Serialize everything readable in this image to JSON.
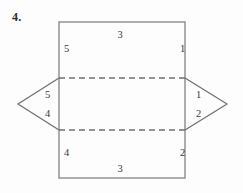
{
  "problem": {
    "number": "4."
  },
  "figure": {
    "name": "net-of-solid-diagram",
    "colors": {
      "stroke": "#8a8a8a",
      "stroke_dark": "#6f6f6f",
      "label": "#3a3a3a",
      "background": "#fdfdfd"
    },
    "rectangle": {
      "left": 59,
      "top": 22,
      "right": 185,
      "bottom": 178
    },
    "fold_lines": [
      {
        "name": "upper-fold-line",
        "y": 78,
        "x1": 59,
        "x2": 185,
        "style": "dashed"
      },
      {
        "name": "lower-fold-line",
        "y": 130,
        "x1": 59,
        "x2": 185,
        "style": "dashed"
      }
    ],
    "left_triangle": {
      "apex_x": 18,
      "apex_y": 104,
      "base_x": 59,
      "top_y": 78,
      "bottom_y": 130
    },
    "right_triangle": {
      "apex_x": 227,
      "apex_y": 104,
      "base_x": 185,
      "top_y": 78,
      "bottom_y": 130
    },
    "labels": [
      {
        "name": "label-top-3",
        "text": "3",
        "x": 120,
        "y": 38,
        "anchor": "middle"
      },
      {
        "name": "label-upper-left-5",
        "text": "5",
        "x": 64,
        "y": 52,
        "anchor": "start"
      },
      {
        "name": "label-upper-right-1",
        "text": "1",
        "x": 180,
        "y": 52,
        "anchor": "start"
      },
      {
        "name": "label-left-triangle-5",
        "text": "5",
        "x": 45,
        "y": 98,
        "anchor": "start"
      },
      {
        "name": "label-left-triangle-4",
        "text": "4",
        "x": 45,
        "y": 117,
        "anchor": "start"
      },
      {
        "name": "label-right-triangle-1",
        "text": "1",
        "x": 196,
        "y": 98,
        "anchor": "start"
      },
      {
        "name": "label-right-triangle-2",
        "text": "2",
        "x": 196,
        "y": 117,
        "anchor": "start"
      },
      {
        "name": "label-lower-left-4",
        "text": "4",
        "x": 64,
        "y": 156,
        "anchor": "start"
      },
      {
        "name": "label-lower-right-2",
        "text": "2",
        "x": 180,
        "y": 156,
        "anchor": "start"
      },
      {
        "name": "label-bottom-3",
        "text": "3",
        "x": 120,
        "y": 172,
        "anchor": "middle"
      }
    ]
  }
}
